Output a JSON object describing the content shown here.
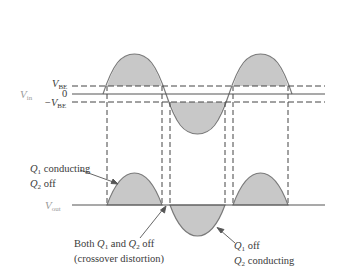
{
  "figure": {
    "type": "class-B push-pull crossover distortion waveforms",
    "input": {
      "label": "V",
      "label_sub": "in",
      "levels": [
        {
          "name": "vbe",
          "prefix": "",
          "text": "V",
          "sub": "BE"
        },
        {
          "name": "zero",
          "text": "0"
        },
        {
          "name": "neg-vbe",
          "prefix": "−",
          "text": "V",
          "sub": "BE"
        }
      ]
    },
    "output": {
      "label": "V",
      "label_sub": "out"
    },
    "annotations": {
      "q1_conducting": {
        "line1_q": "Q",
        "line1_sub": "1",
        "line1_rest": " conducting",
        "line2_q": "Q",
        "line2_sub": "2",
        "line2_rest": " off"
      },
      "both_off": {
        "pre": "Both ",
        "q1": "Q",
        "q1_sub": "1",
        "mid": " and ",
        "q2": "Q",
        "q2_sub": "2",
        "post": " off",
        "line2": "(crossover distortion)"
      },
      "q2_conducting": {
        "line1_q": "Q",
        "line1_sub": "1",
        "line1_rest": " off",
        "line2_q": "Q",
        "line2_sub": "2",
        "line2_rest": " conducting"
      }
    },
    "colors": {
      "fill": "#c8c8c8",
      "stroke": "#7a7a7a",
      "dash": "#444444"
    }
  }
}
